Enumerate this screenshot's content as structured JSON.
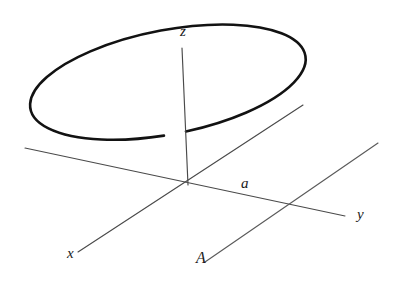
{
  "figure": {
    "kind": "3d-coordinate-diagram",
    "background_color": "#ffffff",
    "ink_color": "#121212",
    "axis_color": "#4a4a4a"
  },
  "labels": {
    "z_axis": "z",
    "x_axis": "x",
    "y_axis": "y",
    "radius": "a",
    "line_a": "A"
  },
  "chart_data": {
    "type": "diagram",
    "title": "",
    "canvas": {
      "width": 400,
      "height": 282
    },
    "origin": {
      "x": 188,
      "y": 185
    },
    "disk": {
      "label": "a",
      "center": {
        "x": 182,
        "y": 185
      },
      "semi_major": 140,
      "semi_minor": 52,
      "rotation_deg": -11,
      "stroke_width": 2.6,
      "gap_at_z_axis": true
    },
    "axes": [
      {
        "name": "z",
        "from": {
          "x": 188,
          "y": 185
        },
        "to": {
          "x": 182,
          "y": 48
        },
        "label": "z",
        "label_pos": {
          "x": 180,
          "y": 36
        }
      },
      {
        "name": "x",
        "from": {
          "x": 78,
          "y": 252
        },
        "to": {
          "x": 303,
          "y": 105
        },
        "label": "x",
        "label_pos": {
          "x": 67,
          "y": 258
        }
      },
      {
        "name": "y",
        "from": {
          "x": 25,
          "y": 148
        },
        "to": {
          "x": 345,
          "y": 216
        },
        "label": "y",
        "label_pos": {
          "x": 357,
          "y": 219
        }
      }
    ],
    "rays": [
      {
        "name": "A",
        "from": {
          "x": 205,
          "y": 262
        },
        "to": {
          "x": 378,
          "y": 143
        },
        "label": "A",
        "label_pos": {
          "x": 196,
          "y": 262
        }
      }
    ],
    "annotations": [
      {
        "text": "a",
        "x": 248,
        "y": 186,
        "meaning": "radius of the disk measured along the y direction"
      }
    ]
  }
}
